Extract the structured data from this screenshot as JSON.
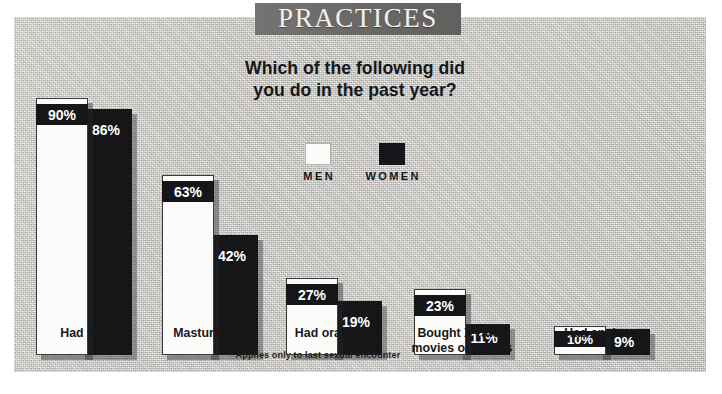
{
  "title": "PRACTICES",
  "subtitle_line1": "Which of the following did",
  "subtitle_line2": "you do in the past year?",
  "legend": {
    "men_label": "MEN",
    "women_label": "WOMEN"
  },
  "footnote": "* Applies only to last sexual encounter",
  "colors": {
    "panel_background": "#c9c7c2",
    "title_banner": "#6e6c6a",
    "men_bar": "#fbfbf9",
    "women_bar": "#161619",
    "text": "#17171a",
    "value_text": "#ffffff"
  },
  "chart_data": {
    "type": "bar",
    "title": "PRACTICES",
    "subtitle": "Which of the following did you do in the past year?",
    "xlabel": "",
    "ylabel": "",
    "ylim": [
      0,
      100
    ],
    "grid": false,
    "legend_position": "center",
    "value_suffix": "%",
    "categories": [
      "Had sex",
      "Masturbated",
      "Had oral sex*",
      "Bought X-rated movies or videos",
      "Had anal sex"
    ],
    "category_lines": [
      [
        "Had sex"
      ],
      [
        "Masturbated"
      ],
      [
        "Had oral sex*"
      ],
      [
        "Bought X-rated",
        "movies or videos"
      ],
      [
        "Had anal sex"
      ]
    ],
    "series": [
      {
        "name": "MEN",
        "color": "#fbfbf9",
        "values": [
          90,
          63,
          27,
          23,
          10
        ],
        "labels": [
          "90%",
          "63%",
          "27%",
          "23%",
          "10%"
        ]
      },
      {
        "name": "WOMEN",
        "color": "#161619",
        "values": [
          86,
          42,
          19,
          11,
          9
        ],
        "labels": [
          "86%",
          "42%",
          "19%",
          "11%",
          "9%"
        ]
      }
    ],
    "footnote": "* Applies only to last sexual encounter"
  }
}
